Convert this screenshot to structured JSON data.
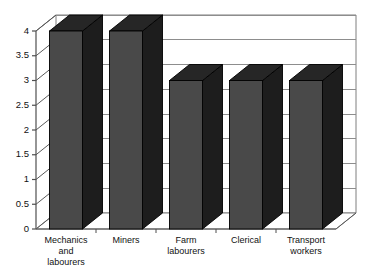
{
  "chart_data": {
    "type": "bar",
    "title": "",
    "subtitle": "",
    "xlabel": "",
    "ylabel": "",
    "categories": [
      "Mechanics and labourers",
      "Miners",
      "Farm labourers",
      "Clerical",
      "Transport workers"
    ],
    "category_lines": [
      [
        "Mechanics",
        "and",
        "labourers"
      ],
      [
        "Miners"
      ],
      [
        "Farm",
        "labourers"
      ],
      [
        "Clerical"
      ],
      [
        "Transport",
        "workers"
      ]
    ],
    "values": [
      4,
      4,
      3,
      3,
      3
    ],
    "ylim": [
      0,
      4
    ],
    "ytick_labels": [
      "4",
      "3.5",
      "3",
      "2.5",
      "2",
      "1.5",
      "1",
      "0.5",
      "0"
    ],
    "ytick_values": [
      4,
      3.5,
      3,
      2.5,
      2,
      1.5,
      1,
      0.5,
      0
    ],
    "grid": true,
    "legend": false,
    "legend_position": "none",
    "style": "3d-column",
    "colors": {
      "bar_front": "#494949",
      "bar_top": "#262626",
      "bar_side": "#1d1d1d",
      "bar_outline": "#000000",
      "wall_back": "#ffffff",
      "floor": "#ffffff",
      "gridline": "#8d8d8d",
      "axis": "#4f4f4f",
      "background": "#ffffff",
      "text": "#111111"
    }
  }
}
